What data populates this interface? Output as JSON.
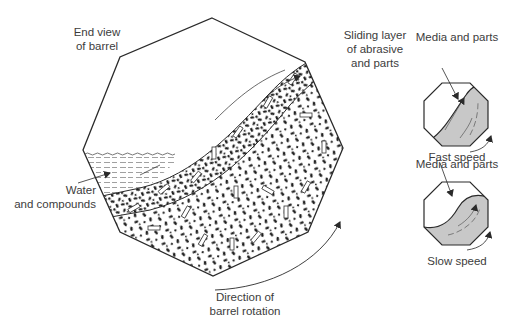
{
  "main_diagram": {
    "labels": {
      "end_view_line1": "End view",
      "end_view_line2": "of barrel",
      "sliding_line1": "Sliding layer",
      "sliding_line2": "of abrasive",
      "sliding_line3": "and parts",
      "water_line1": "Water",
      "water_line2": "and compounds",
      "direction_line1": "Direction of",
      "direction_line2": "barrel rotation"
    }
  },
  "fast_speed_diagram": {
    "top_label": "Media and parts",
    "caption": "Fast speed"
  },
  "slow_speed_diagram": {
    "top_label": "Media and parts",
    "caption": "Slow speed"
  },
  "colors": {
    "outline": "#2a2a2a",
    "media_fill": "#c8c8c8",
    "water_lines": "#666666",
    "particle": "#1e1e1e"
  }
}
